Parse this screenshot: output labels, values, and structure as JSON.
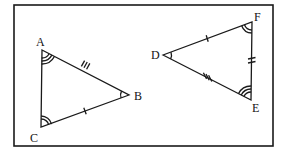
{
  "diagram": {
    "type": "congruent-triangles",
    "stroke_color": "#1a1a1a",
    "background": "#ffffff",
    "triangle_1": {
      "vertices": {
        "A": {
          "label": "A",
          "x": 42,
          "y": 50
        },
        "B": {
          "label": "B",
          "x": 129,
          "y": 95
        },
        "C": {
          "label": "C",
          "x": 41,
          "y": 127
        }
      },
      "side_marks": {
        "AB": 3,
        "BC": 1,
        "CA": 0
      },
      "angle_marks": {
        "A": 3,
        "B": 1,
        "C": 2
      }
    },
    "triangle_2": {
      "vertices": {
        "D": {
          "label": "D",
          "x": 163,
          "y": 55
        },
        "E": {
          "label": "E",
          "x": 251,
          "y": 100
        },
        "F": {
          "label": "F",
          "x": 252,
          "y": 22
        }
      },
      "side_marks": {
        "DF": 1,
        "FE": 2,
        "DE": 3
      },
      "angle_marks": {
        "D": 1,
        "E": 3,
        "F": 2
      }
    }
  }
}
